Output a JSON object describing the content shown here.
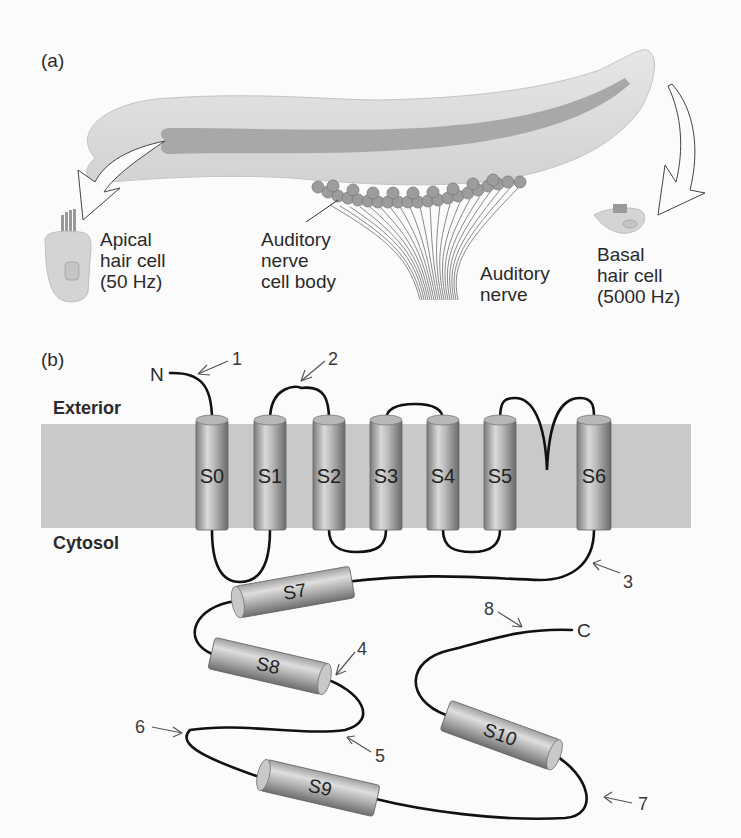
{
  "panel_a": {
    "label": "(a)",
    "apical": {
      "line1": "Apical",
      "line2": "hair cell",
      "line3": "(50 Hz)"
    },
    "nerve_cell_body": {
      "line1": "Auditory",
      "line2": "nerve",
      "line3": "cell body"
    },
    "auditory_nerve": {
      "line1": "Auditory",
      "line2": "nerve"
    },
    "basal": {
      "line1": "Basal",
      "line2": "hair cell",
      "line3": "(5000 Hz)"
    }
  },
  "panel_b": {
    "label": "(b)",
    "exterior": "Exterior",
    "cytosol": "Cytosol",
    "n_terminus": "N",
    "c_terminus": "C",
    "transmembrane_helices": [
      "S0",
      "S1",
      "S2",
      "S3",
      "S4",
      "S5",
      "S6"
    ],
    "cytosolic_helices": [
      "S7",
      "S8",
      "S9",
      "S10"
    ],
    "markers": [
      "1",
      "2",
      "3",
      "4",
      "5",
      "6",
      "7",
      "8"
    ]
  },
  "colors": {
    "membrane": "#c9c9c9",
    "helix_dark": "#6e6e6e",
    "helix_light": "#d8d8d8",
    "cochlea_outer": "#d6d6d6",
    "cochlea_stripe": "#a9a9a9",
    "nerve_cell": "#9a9a9a",
    "chain": "#111111"
  }
}
